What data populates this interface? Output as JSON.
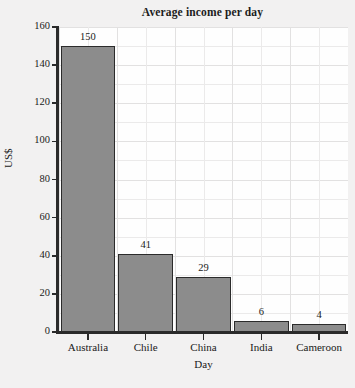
{
  "chart_data": {
    "type": "bar",
    "title": "Average income per day",
    "xlabel": "Day",
    "ylabel": "US$",
    "categories": [
      "Australia",
      "Chile",
      "China",
      "India",
      "Cameroon"
    ],
    "values": [
      150,
      41,
      29,
      6,
      4
    ],
    "value_labels": [
      "150",
      "41",
      "29",
      "6",
      "4"
    ],
    "ylim": [
      0,
      160
    ],
    "yticks": [
      0,
      20,
      40,
      60,
      80,
      100,
      120,
      140,
      160
    ],
    "ytick_labels": [
      "0",
      "20",
      "40",
      "60",
      "80",
      "100",
      "120",
      "140",
      "160"
    ],
    "grid": true,
    "minor_grid": true,
    "legend": null,
    "colors": {
      "bar_fill": "#8c8c8c",
      "bar_edge": "#2b2b2b",
      "plot_background": "#fefefe",
      "figure_background": "#f2f1f1",
      "gridline": "#ebeaea",
      "axis": "#2a2a2a",
      "text": "#1a1a1a"
    }
  }
}
